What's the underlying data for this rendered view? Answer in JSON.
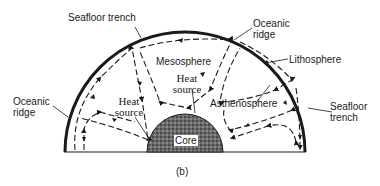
{
  "figure": {
    "caption": "(b)",
    "labels": {
      "seafloor_trench_top": "Seafloor trench",
      "oceanic_ridge_top_line1": "Oceanic",
      "oceanic_ridge_top_line2": "ridge",
      "lithosphere": "Lithosphere",
      "oceanic_ridge_left_line1": "Oceanic",
      "oceanic_ridge_left_line2": "ridge",
      "mesosphere": "Mesosphere",
      "heat_source_center_line1": "Heat",
      "heat_source_center_line2": "source",
      "heat_source_left_line1": "Heat",
      "heat_source_left_line2": "source",
      "asthenosphere": "Asthenosphere",
      "seafloor_trench_right_line1": "Seafloor",
      "seafloor_trench_right_line2": "trench",
      "core": "Core"
    },
    "colors": {
      "ink": "#1a1a1a",
      "core_fill": "#555555",
      "background": "#ffffff"
    }
  }
}
